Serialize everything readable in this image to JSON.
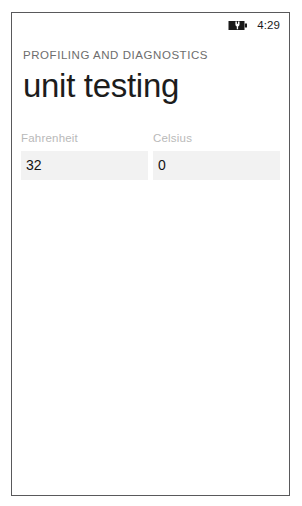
{
  "status_bar": {
    "battery_icon": "battery-charging-icon",
    "time": "4:29"
  },
  "header": {
    "app_name": "PROFILING AND DIAGNOSTICS",
    "page_title": "unit testing"
  },
  "form": {
    "fields": [
      {
        "label": "Fahrenheit",
        "value": "32",
        "placeholder": ""
      },
      {
        "label": "Celsius",
        "value": "0",
        "placeholder": ""
      }
    ]
  },
  "colors": {
    "frame_border": "#59595b",
    "app_name_text": "#6d6d6d",
    "title_text": "#1c1c1c",
    "field_label_text": "#b9b9b9",
    "field_background": "#f2f2f2",
    "field_value_text": "#141414",
    "page_background": "#ffffff"
  }
}
